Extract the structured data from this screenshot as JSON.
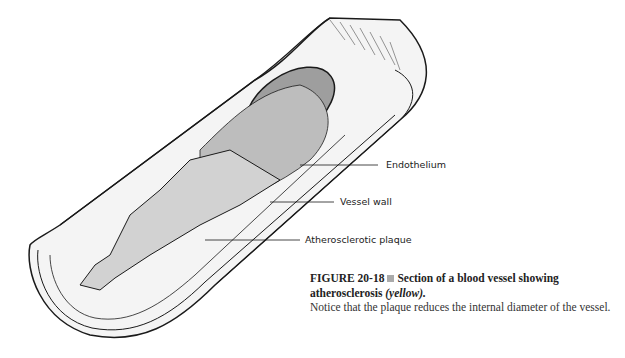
{
  "figure": {
    "labels": [
      {
        "text": "Endothelium"
      },
      {
        "text": "Vessel wall"
      },
      {
        "text": "Atherosclerotic plaque"
      }
    ],
    "caption": {
      "number": "FIGURE 20-18",
      "title": "Section of a blood vessel showing atherosclerosis",
      "title_italic": "(yellow).",
      "description": "Notice that the plaque reduces the internal diameter of the vessel."
    },
    "colors": {
      "line": "#1a1a1a",
      "lumen_shade": "#bdbdbd",
      "plaque_shade": "#e6e6e6",
      "bullet": "#aaaaaa"
    }
  }
}
